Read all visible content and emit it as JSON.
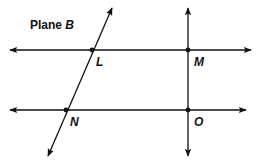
{
  "diagram": {
    "title_prefix": "Plane ",
    "title_name": "B",
    "points": [
      {
        "label": "L",
        "x": 92,
        "y": 50
      },
      {
        "label": "M",
        "x": 188,
        "y": 50
      },
      {
        "label": "N",
        "x": 66,
        "y": 110
      },
      {
        "label": "O",
        "x": 188,
        "y": 110
      }
    ],
    "lines": [
      {
        "name": "line-LM",
        "through": [
          "L",
          "M"
        ],
        "orientation": "horizontal"
      },
      {
        "name": "line-NO",
        "through": [
          "N",
          "O"
        ],
        "orientation": "horizontal"
      },
      {
        "name": "line-LN",
        "through": [
          "L",
          "N"
        ],
        "orientation": "slanted"
      },
      {
        "name": "line-MO",
        "through": [
          "M",
          "O"
        ],
        "orientation": "vertical"
      }
    ],
    "colors": {
      "ink": "#111111",
      "background": "#ffffff"
    }
  }
}
